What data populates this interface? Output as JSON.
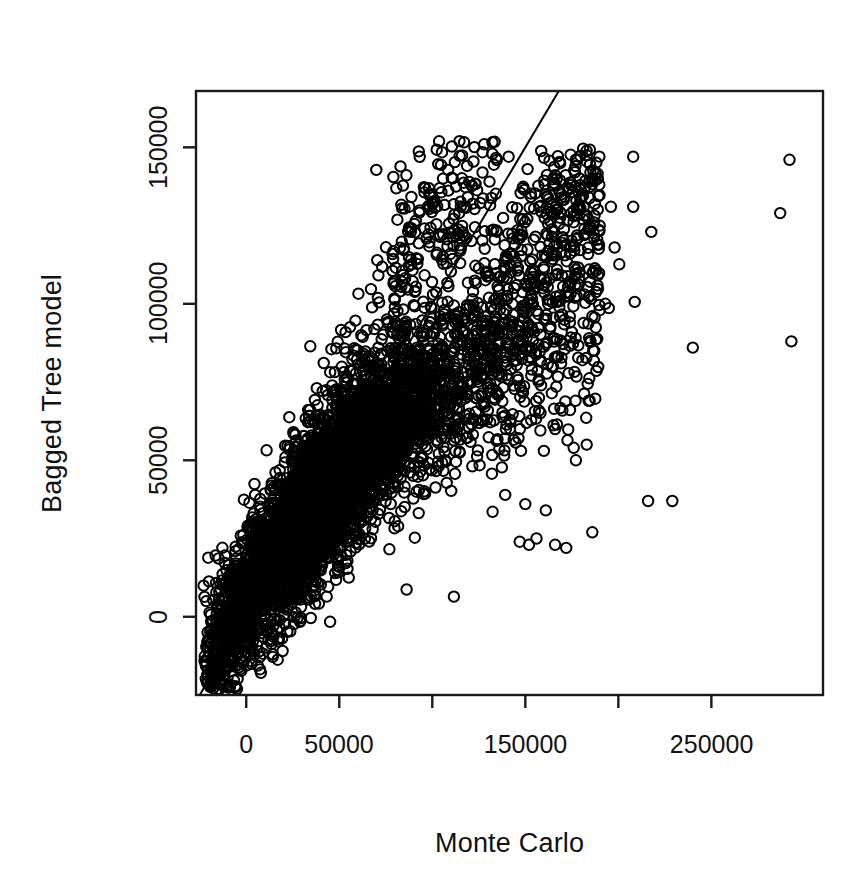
{
  "chart_data": {
    "type": "scatter",
    "title": "",
    "xlabel": "Monte Carlo",
    "ylabel": "Bagged Tree model",
    "xlim": [
      -27000,
      310000
    ],
    "ylim": [
      -25000,
      168000
    ],
    "x_ticks": [
      0,
      50000,
      100000,
      150000,
      200000,
      250000
    ],
    "x_tick_labels": [
      "0",
      "50000",
      "",
      "150000",
      "",
      "250000"
    ],
    "y_ticks": [
      0,
      50000,
      100000,
      150000
    ],
    "y_tick_labels": [
      "0",
      "50000",
      "100000",
      "150000"
    ],
    "grid": false,
    "legend": "none",
    "marker": "open-circle",
    "marker_color": "#000000",
    "marker_radius_px": 5.2,
    "marker_stroke_px": 2.0,
    "n_points": 6000,
    "reference_line": {
      "type": "identity",
      "slope": 1,
      "intercept": 0,
      "color": "#000000",
      "width_px": 2.0
    },
    "cloud": {
      "core_x_center": 46000,
      "core_y_center": 42000,
      "correlation": 0.87,
      "core_x_sd": 27000,
      "core_y_sd": 23000
    },
    "outliers": [
      {
        "x": 208000,
        "y": 147000
      },
      {
        "x": 292000,
        "y": 146000
      },
      {
        "x": 177000,
        "y": 144000
      },
      {
        "x": 141000,
        "y": 147000
      },
      {
        "x": 185000,
        "y": 142000
      },
      {
        "x": 189000,
        "y": 140000
      },
      {
        "x": 208000,
        "y": 131000
      },
      {
        "x": 287000,
        "y": 129000
      },
      {
        "x": 196000,
        "y": 131000
      },
      {
        "x": 176000,
        "y": 128000
      },
      {
        "x": 181000,
        "y": 127000
      },
      {
        "x": 184000,
        "y": 127000
      },
      {
        "x": 187000,
        "y": 126000
      },
      {
        "x": 190000,
        "y": 125000
      },
      {
        "x": 198000,
        "y": 118000
      },
      {
        "x": 174000,
        "y": 116000
      },
      {
        "x": 115000,
        "y": 113000
      },
      {
        "x": 128000,
        "y": 113000
      },
      {
        "x": 179000,
        "y": 110000
      },
      {
        "x": 160000,
        "y": 111000
      },
      {
        "x": 193000,
        "y": 100000
      },
      {
        "x": 186000,
        "y": 96000
      },
      {
        "x": 175000,
        "y": 91000
      },
      {
        "x": 240000,
        "y": 86000
      },
      {
        "x": 293000,
        "y": 88000
      },
      {
        "x": 187000,
        "y": 85000
      },
      {
        "x": 177000,
        "y": 69000
      },
      {
        "x": 184000,
        "y": 69000
      },
      {
        "x": 166000,
        "y": 60000
      },
      {
        "x": 176000,
        "y": 54000
      },
      {
        "x": 183000,
        "y": 55000
      },
      {
        "x": 160000,
        "y": 53000
      },
      {
        "x": 216000,
        "y": 37000
      },
      {
        "x": 229000,
        "y": 37000
      },
      {
        "x": 150000,
        "y": 36000
      },
      {
        "x": 161000,
        "y": 34000
      },
      {
        "x": 186000,
        "y": 27000
      },
      {
        "x": 156000,
        "y": 25000
      },
      {
        "x": 166000,
        "y": 23000
      },
      {
        "x": 172000,
        "y": 22000
      },
      {
        "x": 147000,
        "y": 24000
      },
      {
        "x": 152000,
        "y": 23000
      }
    ]
  },
  "plot": {
    "x_axis_title": "Monte Carlo",
    "y_axis_title": "Bagged Tree model",
    "x_tick_labels": [
      "0",
      "50000",
      "150000",
      "250000"
    ],
    "y_tick_labels": [
      "0",
      "50000",
      "100000",
      "150000"
    ]
  }
}
